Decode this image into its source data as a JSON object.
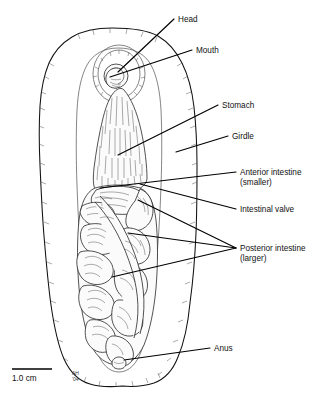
{
  "figure": {
    "organism": "chiton",
    "line_color": "#111111",
    "background_color": "#ffffff"
  },
  "labels": [
    {
      "id": "head",
      "text": "Head",
      "text2": "",
      "x": 178,
      "y": 22,
      "leader_from_x": 174,
      "leader_from_y": 19,
      "leader_to_x": 118,
      "leader_to_y": 72
    },
    {
      "id": "mouth",
      "text": "Mouth",
      "text2": "",
      "x": 196,
      "y": 53,
      "leader_from_x": 192,
      "leader_from_y": 50,
      "leader_to_x": 110,
      "leader_to_y": 77
    },
    {
      "id": "stomach",
      "text": "Stomach",
      "text2": "",
      "x": 222,
      "y": 108,
      "leader_from_x": 218,
      "leader_from_y": 105,
      "leader_to_x": 118,
      "leader_to_y": 155
    },
    {
      "id": "girdle",
      "text": "Girdle",
      "text2": "",
      "x": 232,
      "y": 139,
      "leader_from_x": 228,
      "leader_from_y": 136,
      "leader_to_x": 176,
      "leader_to_y": 152
    },
    {
      "id": "anterior-intestine",
      "text": "Anterior intestine",
      "text2": "(smaller)",
      "x": 240,
      "y": 175,
      "leader_from_x": 236,
      "leader_from_y": 172,
      "leader_to_x": 100,
      "leader_to_y": 188
    },
    {
      "id": "intestinal-valve",
      "text": "Intestinal valve",
      "text2": "",
      "x": 240,
      "y": 212,
      "leader_from_x": 236,
      "leader_from_y": 209,
      "leader_to_x": 140,
      "leader_to_y": 184
    },
    {
      "id": "posterior-intestine",
      "text": "Posterior intestine",
      "text2": "(larger)",
      "x": 240,
      "y": 251,
      "leader_from_x": 236,
      "leader_from_y": 248,
      "leader_to_x": 138,
      "leader_to_y": 200
    },
    {
      "id": "anus",
      "text": "Anus",
      "text2": "",
      "x": 214,
      "y": 351,
      "leader_from_x": 210,
      "leader_from_y": 348,
      "leader_to_x": 124,
      "leader_to_y": 360
    }
  ],
  "extra_leaders": [
    {
      "id": "posterior-intestine-2",
      "from_x": 236,
      "from_y": 248,
      "to_x": 128,
      "to_y": 233
    },
    {
      "id": "posterior-intestine-3",
      "from_x": 236,
      "from_y": 248,
      "to_x": 112,
      "to_y": 277
    }
  ],
  "scale": {
    "label": "1.0 cm",
    "bar_x1": 12,
    "bar_x2": 52,
    "bar_y": 369,
    "text_x": 12,
    "text_y": 381
  },
  "signature": {
    "line1": "AH",
    "line2": "'04",
    "x": 72,
    "y": 375
  }
}
